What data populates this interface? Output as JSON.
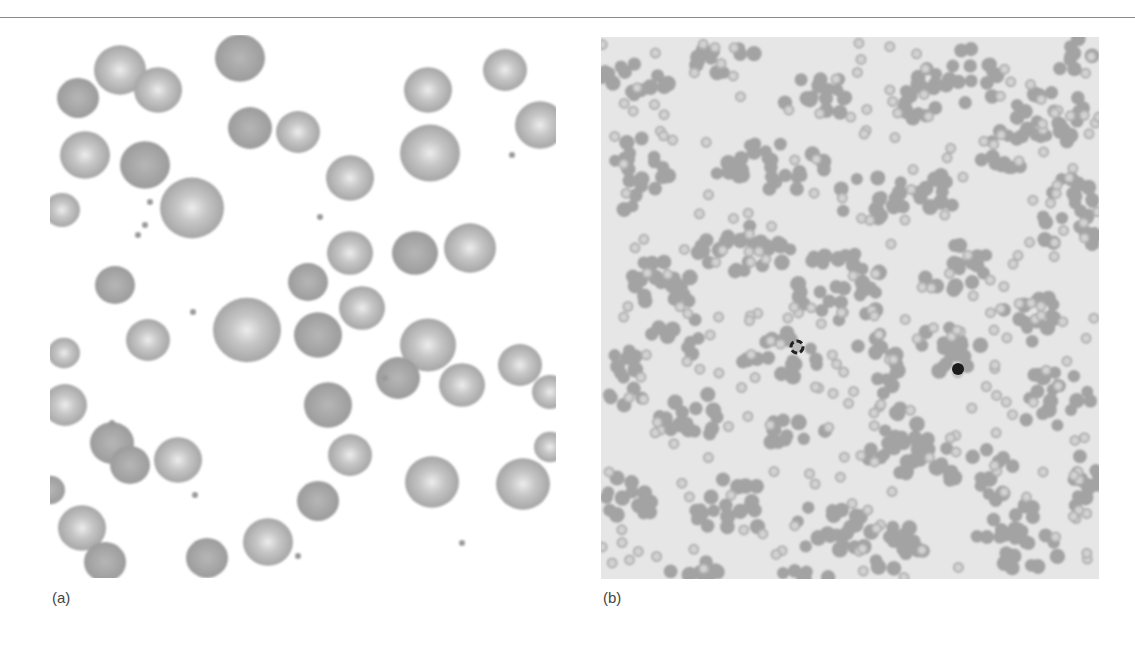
{
  "figure": {
    "panels": [
      {
        "label": "(a)",
        "description": "micrograph of scattered red blood cells, high magnification",
        "background": "#ffffff",
        "cell_color": "#a9a9a9",
        "cells": [
          {
            "x": 70,
            "y": 35,
            "r": 26,
            "pale": true
          },
          {
            "x": 28,
            "y": 63,
            "r": 21,
            "pale": false
          },
          {
            "x": 108,
            "y": 55,
            "r": 24,
            "pale": true
          },
          {
            "x": 190,
            "y": 23,
            "r": 25,
            "pale": false
          },
          {
            "x": 35,
            "y": 120,
            "r": 25,
            "pale": true
          },
          {
            "x": 95,
            "y": 130,
            "r": 25,
            "pale": false
          },
          {
            "x": 200,
            "y": 93,
            "r": 22,
            "pale": false
          },
          {
            "x": 248,
            "y": 97,
            "r": 22,
            "pale": true
          },
          {
            "x": 300,
            "y": 143,
            "r": 24,
            "pale": true
          },
          {
            "x": 378,
            "y": 55,
            "r": 24,
            "pale": true
          },
          {
            "x": 380,
            "y": 118,
            "r": 30,
            "pale": true
          },
          {
            "x": 455,
            "y": 35,
            "r": 22,
            "pale": true
          },
          {
            "x": 490,
            "y": 90,
            "r": 25,
            "pale": true
          },
          {
            "x": 142,
            "y": 173,
            "r": 32,
            "pale": true
          },
          {
            "x": 12,
            "y": 175,
            "r": 18,
            "pale": true
          },
          {
            "x": 65,
            "y": 250,
            "r": 20,
            "pale": false
          },
          {
            "x": 300,
            "y": 218,
            "r": 23,
            "pale": true
          },
          {
            "x": 365,
            "y": 218,
            "r": 23,
            "pale": false
          },
          {
            "x": 420,
            "y": 213,
            "r": 26,
            "pale": true
          },
          {
            "x": 258,
            "y": 247,
            "r": 20,
            "pale": false
          },
          {
            "x": 197,
            "y": 295,
            "r": 34,
            "pale": true
          },
          {
            "x": 312,
            "y": 273,
            "r": 23,
            "pale": true
          },
          {
            "x": 268,
            "y": 300,
            "r": 24,
            "pale": false
          },
          {
            "x": 98,
            "y": 305,
            "r": 22,
            "pale": true
          },
          {
            "x": 378,
            "y": 310,
            "r": 28,
            "pale": true
          },
          {
            "x": 348,
            "y": 343,
            "r": 22,
            "pale": false
          },
          {
            "x": 412,
            "y": 350,
            "r": 23,
            "pale": true
          },
          {
            "x": 470,
            "y": 330,
            "r": 22,
            "pale": true
          },
          {
            "x": 14,
            "y": 318,
            "r": 16,
            "pale": true
          },
          {
            "x": 15,
            "y": 370,
            "r": 22,
            "pale": true
          },
          {
            "x": 278,
            "y": 370,
            "r": 24,
            "pale": false
          },
          {
            "x": 500,
            "y": 357,
            "r": 18,
            "pale": true
          },
          {
            "x": 62,
            "y": 408,
            "r": 22,
            "pale": false
          },
          {
            "x": 80,
            "y": 430,
            "r": 20,
            "pale": false
          },
          {
            "x": 128,
            "y": 425,
            "r": 24,
            "pale": true
          },
          {
            "x": 300,
            "y": 420,
            "r": 22,
            "pale": true
          },
          {
            "x": 268,
            "y": 466,
            "r": 21,
            "pale": false
          },
          {
            "x": 382,
            "y": 447,
            "r": 27,
            "pale": true
          },
          {
            "x": 473,
            "y": 449,
            "r": 27,
            "pale": true
          },
          {
            "x": 500,
            "y": 412,
            "r": 16,
            "pale": true
          },
          {
            "x": 32,
            "y": 493,
            "r": 24,
            "pale": true
          },
          {
            "x": 55,
            "y": 527,
            "r": 21,
            "pale": false
          },
          {
            "x": 157,
            "y": 523,
            "r": 21,
            "pale": false
          },
          {
            "x": 218,
            "y": 507,
            "r": 25,
            "pale": true
          },
          {
            "x": 0,
            "y": 455,
            "r": 15,
            "pale": false
          }
        ],
        "platelets": [
          {
            "x": 100,
            "y": 167
          },
          {
            "x": 88,
            "y": 200
          },
          {
            "x": 143,
            "y": 277
          },
          {
            "x": 62,
            "y": 388
          },
          {
            "x": 145,
            "y": 460
          },
          {
            "x": 335,
            "y": 343
          },
          {
            "x": 270,
            "y": 182
          },
          {
            "x": 462,
            "y": 120
          },
          {
            "x": 412,
            "y": 508
          },
          {
            "x": 248,
            "y": 521
          },
          {
            "x": 95,
            "y": 190
          }
        ]
      },
      {
        "label": "(b)",
        "description": "low-magnification micrograph showing clumped red blood cells (agglutination)",
        "background": "#e6e6e6",
        "cell_color": "#a3a3a3",
        "clusters": [
          {
            "x": 30,
            "y": 40,
            "rx": 40,
            "ry": 22
          },
          {
            "x": 120,
            "y": 20,
            "rx": 35,
            "ry": 18
          },
          {
            "x": 220,
            "y": 60,
            "rx": 40,
            "ry": 22
          },
          {
            "x": 310,
            "y": 70,
            "rx": 28,
            "ry": 20
          },
          {
            "x": 360,
            "y": 40,
            "rx": 45,
            "ry": 30
          },
          {
            "x": 440,
            "y": 80,
            "rx": 50,
            "ry": 30
          },
          {
            "x": 40,
            "y": 140,
            "rx": 30,
            "ry": 40
          },
          {
            "x": 170,
            "y": 130,
            "rx": 60,
            "ry": 28
          },
          {
            "x": 275,
            "y": 160,
            "rx": 45,
            "ry": 25
          },
          {
            "x": 340,
            "y": 155,
            "rx": 30,
            "ry": 18
          },
          {
            "x": 400,
            "y": 120,
            "rx": 30,
            "ry": 22
          },
          {
            "x": 470,
            "y": 180,
            "rx": 35,
            "ry": 40
          },
          {
            "x": 60,
            "y": 250,
            "rx": 40,
            "ry": 28
          },
          {
            "x": 145,
            "y": 210,
            "rx": 50,
            "ry": 30
          },
          {
            "x": 240,
            "y": 250,
            "rx": 45,
            "ry": 40
          },
          {
            "x": 355,
            "y": 230,
            "rx": 35,
            "ry": 25
          },
          {
            "x": 430,
            "y": 280,
            "rx": 30,
            "ry": 25
          },
          {
            "x": 25,
            "y": 340,
            "rx": 25,
            "ry": 30
          },
          {
            "x": 80,
            "y": 300,
            "rx": 30,
            "ry": 20
          },
          {
            "x": 180,
            "y": 320,
            "rx": 40,
            "ry": 25
          },
          {
            "x": 275,
            "y": 330,
            "rx": 25,
            "ry": 35
          },
          {
            "x": 345,
            "y": 310,
            "rx": 40,
            "ry": 25
          },
          {
            "x": 450,
            "y": 360,
            "rx": 40,
            "ry": 30
          },
          {
            "x": 90,
            "y": 380,
            "rx": 40,
            "ry": 25
          },
          {
            "x": 195,
            "y": 395,
            "rx": 30,
            "ry": 22
          },
          {
            "x": 310,
            "y": 410,
            "rx": 45,
            "ry": 40
          },
          {
            "x": 380,
            "y": 440,
            "rx": 35,
            "ry": 28
          },
          {
            "x": 30,
            "y": 460,
            "rx": 30,
            "ry": 25
          },
          {
            "x": 130,
            "y": 470,
            "rx": 40,
            "ry": 30
          },
          {
            "x": 230,
            "y": 490,
            "rx": 35,
            "ry": 30
          },
          {
            "x": 300,
            "y": 510,
            "rx": 40,
            "ry": 25
          },
          {
            "x": 420,
            "y": 500,
            "rx": 45,
            "ry": 35
          },
          {
            "x": 480,
            "y": 440,
            "rx": 25,
            "ry": 30
          },
          {
            "x": 90,
            "y": 530,
            "rx": 30,
            "ry": 15
          },
          {
            "x": 200,
            "y": 540,
            "rx": 35,
            "ry": 10
          },
          {
            "x": 470,
            "y": 20,
            "rx": 25,
            "ry": 20
          }
        ],
        "dark_cells": [
          {
            "x": 196,
            "y": 310,
            "r": 6,
            "ring": true
          },
          {
            "x": 357,
            "y": 332,
            "r": 6,
            "ring": false
          }
        ]
      }
    ]
  }
}
